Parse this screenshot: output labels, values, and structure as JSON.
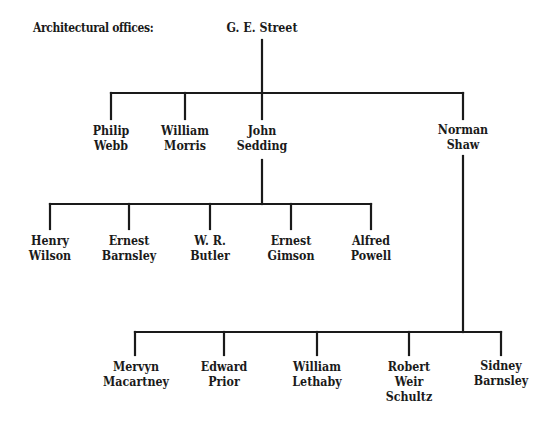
{
  "caption": "Architectural offices:",
  "line_color": "#1a1a1a",
  "root": {
    "name": [
      "G. E. Street"
    ]
  },
  "level1": [
    {
      "name": [
        "Philip",
        "Webb"
      ]
    },
    {
      "name": [
        "William",
        "Morris"
      ]
    },
    {
      "name": [
        "John",
        "Sedding"
      ]
    },
    {
      "name": [
        "Norman",
        "Shaw"
      ]
    }
  ],
  "sedding_children": [
    {
      "name": [
        "Henry",
        "Wilson"
      ]
    },
    {
      "name": [
        "Ernest",
        "Barnsley"
      ]
    },
    {
      "name": [
        "W. R.",
        "Butler"
      ]
    },
    {
      "name": [
        "Ernest",
        "Gimson"
      ]
    },
    {
      "name": [
        "Alfred",
        "Powell"
      ]
    }
  ],
  "shaw_children": [
    {
      "name": [
        "Mervyn",
        "Macartney"
      ]
    },
    {
      "name": [
        "Edward",
        "Prior"
      ]
    },
    {
      "name": [
        "William",
        "Lethaby"
      ]
    },
    {
      "name": [
        "Robert",
        "Weir",
        "Schultz"
      ]
    },
    {
      "name": [
        "Sidney",
        "Barnsley"
      ]
    }
  ]
}
